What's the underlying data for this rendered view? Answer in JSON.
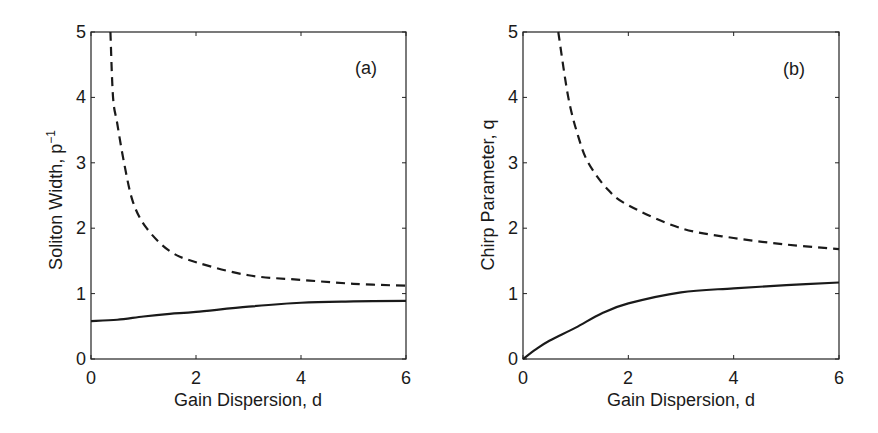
{
  "figure": {
    "panels": [
      {
        "tag": "(a)",
        "xlabel": "Gain Dispersion, d",
        "ylabel_main": "Soliton Width, p",
        "ylabel_sup": "−1",
        "xticks": [
          "0",
          "2",
          "4",
          "6"
        ],
        "yticks": [
          "0",
          "1",
          "2",
          "3",
          "4",
          "5"
        ]
      },
      {
        "tag": "(b)",
        "xlabel": "Gain Dispersion, d",
        "ylabel_main": "Chirp Parameter, q",
        "ylabel_sup": "",
        "xticks": [
          "0",
          "2",
          "4",
          "6"
        ],
        "yticks": [
          "0",
          "1",
          "2",
          "3",
          "4",
          "5"
        ]
      }
    ]
  },
  "chart_data": [
    {
      "type": "line",
      "title": "(a)",
      "xlabel": "Gain Dispersion, d",
      "ylabel": "Soliton Width, p^-1",
      "xlim": [
        0,
        6
      ],
      "ylim": [
        0,
        5
      ],
      "xticks": [
        0,
        2,
        4,
        6
      ],
      "yticks": [
        0,
        1,
        2,
        3,
        4,
        5
      ],
      "grid": false,
      "legend": null,
      "series": [
        {
          "name": "dashed",
          "style": "dashed",
          "x": [
            0.37,
            0.42,
            0.5,
            0.63,
            0.8,
            1.06,
            1.5,
            2,
            3,
            4,
            5,
            6
          ],
          "y": [
            5.0,
            4.0,
            3.6,
            3.0,
            2.4,
            2.0,
            1.65,
            1.48,
            1.28,
            1.21,
            1.15,
            1.12
          ]
        },
        {
          "name": "solid",
          "style": "solid",
          "x": [
            0,
            0.5,
            1,
            1.5,
            2,
            3,
            4,
            5,
            6
          ],
          "y": [
            0.58,
            0.6,
            0.65,
            0.69,
            0.72,
            0.8,
            0.86,
            0.88,
            0.89
          ]
        }
      ]
    },
    {
      "type": "line",
      "title": "(b)",
      "xlabel": "Gain Dispersion, d",
      "ylabel": "Chirp Parameter, q",
      "xlim": [
        0,
        6
      ],
      "ylim": [
        0,
        5
      ],
      "xticks": [
        0,
        2,
        4,
        6
      ],
      "yticks": [
        0,
        1,
        2,
        3,
        4,
        5
      ],
      "grid": false,
      "legend": null,
      "series": [
        {
          "name": "dashed",
          "style": "dashed",
          "x": [
            0.67,
            0.86,
            1.05,
            1.24,
            1.6,
            2,
            3,
            4,
            5,
            6
          ],
          "y": [
            5.0,
            4.0,
            3.4,
            3.0,
            2.6,
            2.35,
            2.0,
            1.85,
            1.75,
            1.68
          ]
        },
        {
          "name": "solid",
          "style": "solid",
          "x": [
            0,
            0.25,
            0.5,
            1,
            1.5,
            2,
            3,
            4,
            5,
            6
          ],
          "y": [
            0,
            0.15,
            0.28,
            0.48,
            0.7,
            0.85,
            1.02,
            1.08,
            1.13,
            1.17
          ]
        }
      ]
    }
  ]
}
